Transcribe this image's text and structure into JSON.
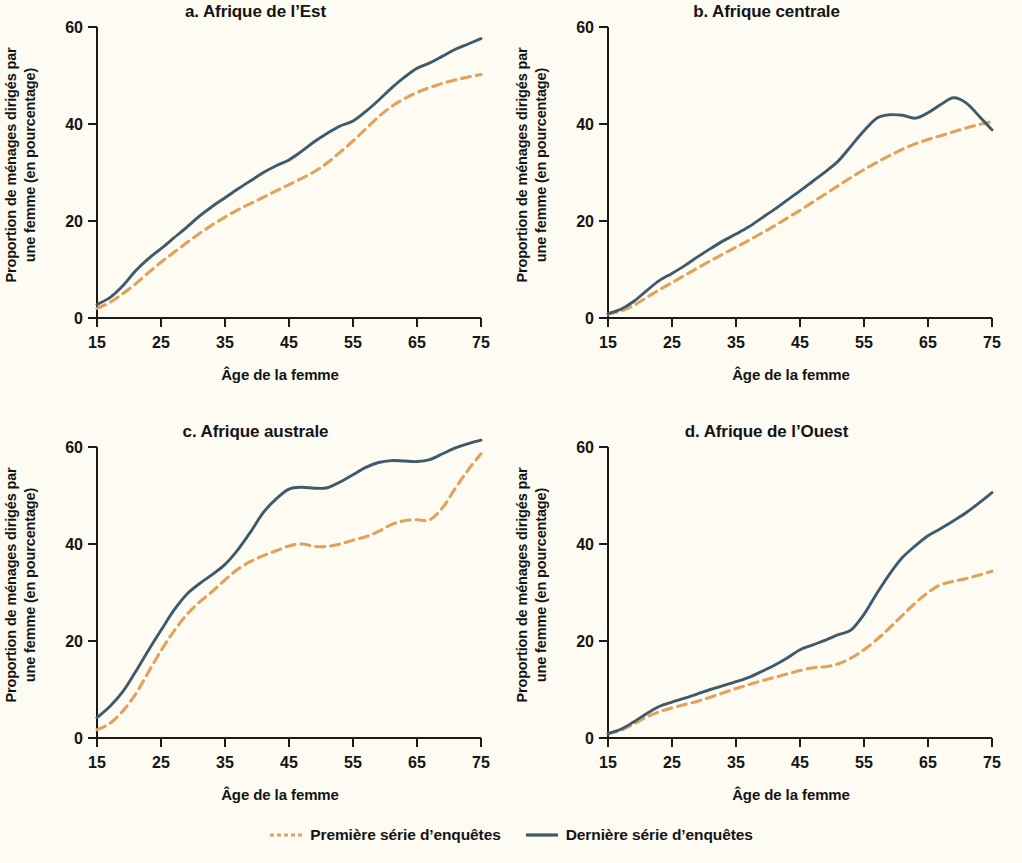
{
  "figure": {
    "background_color": "#fdfbf2",
    "series_colors": {
      "premiere": "#e2a25c",
      "derniere": "#3f5a6b"
    }
  },
  "legend": {
    "items": [
      {
        "label": "Première série d’enquêtes",
        "style": "dashed",
        "color": "#e2a25c"
      },
      {
        "label": "Dernière série d’enquêtes",
        "style": "solid",
        "color": "#3f5a6b"
      }
    ]
  },
  "panels": {
    "a": {
      "title": "a. Afrique de l’Est",
      "xlabel": "Âge de la femme",
      "ylabel_line1": "Proportion de ménages dirigés par",
      "ylabel_line2": "une femme (en pourcentage)"
    },
    "b": {
      "title": "b. Afrique centrale",
      "xlabel": "Âge de la femme",
      "ylabel_line1": "Proportion de ménages dirigés par",
      "ylabel_line2": "une femme (en pourcentage)"
    },
    "c": {
      "title": "c. Afrique australe",
      "xlabel": "Âge de la femme",
      "ylabel_line1": "Proportion de ménages dirigés par",
      "ylabel_line2": "une femme (en pourcentage)"
    },
    "d": {
      "title": "d. Afrique de l’Ouest",
      "xlabel": "Âge de la femme",
      "ylabel_line1": "Proportion de ménages dirigés par",
      "ylabel_line2": "une femme (en pourcentage)"
    }
  },
  "axes": {
    "xticks": [
      "15",
      "25",
      "35",
      "45",
      "55",
      "65",
      "75"
    ],
    "yticks": [
      "0",
      "20",
      "40",
      "60"
    ],
    "xlim": [
      15,
      75
    ],
    "ylim": [
      0,
      60
    ]
  },
  "chart_data": [
    {
      "type": "line",
      "panel": "a",
      "title": "a. Afrique de l’Est",
      "xlabel": "Âge de la femme",
      "ylabel": "Proportion de ménages dirigés par une femme (en pourcentage)",
      "xlim": [
        15,
        75
      ],
      "ylim": [
        0,
        60
      ],
      "xticks": [
        15,
        25,
        35,
        45,
        55,
        65,
        75
      ],
      "yticks": [
        0,
        20,
        40,
        60
      ],
      "grid": false,
      "legend_position": "bottom",
      "x": [
        15,
        17,
        19,
        21,
        23,
        25,
        27,
        29,
        31,
        33,
        35,
        37,
        39,
        41,
        43,
        45,
        47,
        49,
        51,
        53,
        55,
        57,
        59,
        61,
        63,
        65,
        67,
        69,
        71,
        73,
        75
      ],
      "series": [
        {
          "name": "Première série d’enquêtes",
          "style": "dashed",
          "color": "#e2a25c",
          "values": [
            2.0,
            3.2,
            5.0,
            7.0,
            9.3,
            11.5,
            13.5,
            15.5,
            17.4,
            19.2,
            20.8,
            22.3,
            23.6,
            24.9,
            26.2,
            27.5,
            28.8,
            30.2,
            32.0,
            34.2,
            36.5,
            39.0,
            41.5,
            43.6,
            45.2,
            46.5,
            47.5,
            48.4,
            49.1,
            49.7,
            50.2
          ]
        },
        {
          "name": "Dernière série d’enquêtes",
          "style": "solid",
          "color": "#3f5a6b",
          "values": [
            2.8,
            4.2,
            6.6,
            9.7,
            12.2,
            14.3,
            16.5,
            18.7,
            21.0,
            23.0,
            24.8,
            26.6,
            28.3,
            30.0,
            31.4,
            32.6,
            34.4,
            36.4,
            38.1,
            39.6,
            40.6,
            42.6,
            44.9,
            47.4,
            49.6,
            51.5,
            52.6,
            54.0,
            55.4,
            56.5,
            57.6
          ]
        }
      ]
    },
    {
      "type": "line",
      "panel": "b",
      "title": "b. Afrique centrale",
      "xlabel": "Âge de la femme",
      "ylabel": "Proportion de ménages dirigés par une femme (en pourcentage)",
      "xlim": [
        15,
        75
      ],
      "ylim": [
        0,
        60
      ],
      "xticks": [
        15,
        25,
        35,
        45,
        55,
        65,
        75
      ],
      "yticks": [
        0,
        20,
        40,
        60
      ],
      "grid": false,
      "legend_position": "bottom",
      "x": [
        15,
        17,
        19,
        21,
        23,
        25,
        27,
        29,
        31,
        33,
        35,
        37,
        39,
        41,
        43,
        45,
        47,
        49,
        51,
        53,
        55,
        57,
        59,
        61,
        63,
        65,
        67,
        69,
        71,
        73,
        75
      ],
      "series": [
        {
          "name": "Première série d’enquêtes",
          "style": "dashed",
          "color": "#e2a25c",
          "values": [
            0.8,
            1.4,
            2.6,
            4.2,
            5.8,
            7.3,
            8.8,
            10.3,
            11.8,
            13.2,
            14.6,
            16.0,
            17.5,
            19.0,
            20.6,
            22.2,
            23.9,
            25.6,
            27.3,
            29.0,
            30.6,
            32.1,
            33.5,
            34.8,
            35.9,
            36.8,
            37.6,
            38.4,
            39.2,
            39.9,
            40.5
          ]
        },
        {
          "name": "Dernière série d’enquêtes",
          "style": "solid",
          "color": "#3f5a6b",
          "values": [
            0.9,
            1.8,
            3.4,
            5.6,
            7.7,
            9.2,
            10.8,
            12.6,
            14.3,
            15.9,
            17.3,
            18.8,
            20.6,
            22.4,
            24.3,
            26.2,
            28.2,
            30.2,
            32.4,
            35.5,
            38.6,
            41.2,
            41.9,
            41.8,
            41.2,
            42.3,
            44.0,
            45.4,
            44.3,
            41.6,
            38.8
          ]
        }
      ]
    },
    {
      "type": "line",
      "panel": "c",
      "title": "c. Afrique australe",
      "xlabel": "Âge de la femme",
      "ylabel": "Proportion de ménages dirigés par une femme (en pourcentage)",
      "xlim": [
        15,
        75
      ],
      "ylim": [
        0,
        60
      ],
      "xticks": [
        15,
        25,
        35,
        45,
        55,
        65,
        75
      ],
      "yticks": [
        0,
        20,
        40,
        60
      ],
      "grid": false,
      "legend_position": "bottom",
      "x": [
        15,
        17,
        19,
        21,
        23,
        25,
        27,
        29,
        31,
        33,
        35,
        37,
        39,
        41,
        43,
        45,
        47,
        49,
        51,
        53,
        55,
        57,
        59,
        61,
        63,
        65,
        67,
        69,
        71,
        73,
        75
      ],
      "series": [
        {
          "name": "Première série d’enquêtes",
          "style": "dashed",
          "color": "#e2a25c",
          "values": [
            1.7,
            3.0,
            5.5,
            9.0,
            13.5,
            18.0,
            22.0,
            25.4,
            28.0,
            30.2,
            32.6,
            34.8,
            36.4,
            37.6,
            38.6,
            39.6,
            40.0,
            39.5,
            39.5,
            40.0,
            40.8,
            41.5,
            42.6,
            44.0,
            44.8,
            45.0,
            45.0,
            47.5,
            51.5,
            55.3,
            58.6
          ]
        },
        {
          "name": "Dernière série d’enquêtes",
          "style": "solid",
          "color": "#3f5a6b",
          "values": [
            4.2,
            6.5,
            9.5,
            13.6,
            18.0,
            22.2,
            26.3,
            29.6,
            31.8,
            33.7,
            35.8,
            38.8,
            42.5,
            46.5,
            49.3,
            51.3,
            51.7,
            51.5,
            51.6,
            52.8,
            54.3,
            55.8,
            56.8,
            57.2,
            57.1,
            57.0,
            57.4,
            58.6,
            59.8,
            60.7,
            61.4
          ]
        }
      ]
    },
    {
      "type": "line",
      "panel": "d",
      "title": "d. Afrique de l’Ouest",
      "xlabel": "Âge de la femme",
      "ylabel": "Proportion de ménages dirigés par une femme (en pourcentage)",
      "xlim": [
        15,
        75
      ],
      "ylim": [
        0,
        60
      ],
      "xticks": [
        15,
        25,
        35,
        45,
        55,
        65,
        75
      ],
      "yticks": [
        0,
        20,
        40,
        60
      ],
      "grid": false,
      "legend_position": "bottom",
      "x": [
        15,
        17,
        19,
        21,
        23,
        25,
        27,
        29,
        31,
        33,
        35,
        37,
        39,
        41,
        43,
        45,
        47,
        49,
        51,
        53,
        55,
        57,
        59,
        61,
        63,
        65,
        67,
        69,
        71,
        73,
        75
      ],
      "series": [
        {
          "name": "Première série d’enquêtes",
          "style": "dashed",
          "color": "#e2a25c",
          "values": [
            0.9,
            1.6,
            2.9,
            4.3,
            5.4,
            6.2,
            6.9,
            7.6,
            8.4,
            9.3,
            10.2,
            11.0,
            11.8,
            12.5,
            13.2,
            13.9,
            14.5,
            14.7,
            15.3,
            16.5,
            18.2,
            20.3,
            22.7,
            25.3,
            27.8,
            30.0,
            31.6,
            32.3,
            32.9,
            33.6,
            34.4
          ]
        },
        {
          "name": "Dernière série d’enquêtes",
          "style": "solid",
          "color": "#3f5a6b",
          "values": [
            0.9,
            1.8,
            3.3,
            5.0,
            6.5,
            7.4,
            8.2,
            9.1,
            10.0,
            10.8,
            11.6,
            12.5,
            13.7,
            15.0,
            16.5,
            18.2,
            19.2,
            20.2,
            21.3,
            22.3,
            25.5,
            29.8,
            33.8,
            37.2,
            39.6,
            41.7,
            43.2,
            44.8,
            46.5,
            48.5,
            50.6
          ]
        }
      ]
    }
  ]
}
